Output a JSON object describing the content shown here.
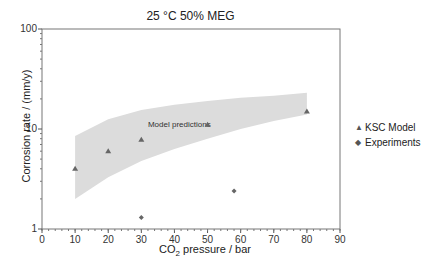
{
  "chart_data": {
    "type": "scatter",
    "title": "25 °C 50% MEG",
    "xlabel": "CO2 pressure / bar",
    "ylabel": "Corrosion rate / (mm/y)",
    "xlim": [
      0,
      90
    ],
    "ylim": [
      1,
      100
    ],
    "yscale": "log",
    "xticks": [
      0,
      10,
      20,
      30,
      40,
      50,
      60,
      70,
      80,
      90
    ],
    "yticks": [
      1,
      10,
      100
    ],
    "grid": false,
    "legend_position": "right",
    "series": [
      {
        "name": "KSC Model",
        "marker": "triangle",
        "color": "#666666",
        "x": [
          10,
          20,
          30,
          50,
          80
        ],
        "y": [
          4.0,
          6.0,
          7.8,
          11.0,
          15.0
        ]
      },
      {
        "name": "Experiments",
        "marker": "diamond",
        "color": "#666666",
        "x": [
          30,
          58
        ],
        "y": [
          1.3,
          2.4
        ]
      }
    ],
    "band": {
      "label": "Model predictions",
      "color": "#dcdcdc",
      "x": [
        10,
        20,
        30,
        40,
        50,
        60,
        70,
        80
      ],
      "upper": [
        8.5,
        12.5,
        15.5,
        17.5,
        19.0,
        20.5,
        21.5,
        23.0
      ],
      "lower": [
        2.0,
        3.3,
        4.8,
        6.3,
        8.0,
        10.0,
        12.0,
        14.0
      ]
    }
  },
  "labels": {
    "title": "25 °C 50% MEG",
    "ylabel": "Corrosion rate / (mm/y)",
    "xlabel_main": "CO",
    "xlabel_sub": "2",
    "xlabel_rest": " pressure / bar",
    "band_label": "Model predictions"
  },
  "legend": [
    {
      "marker": "▲",
      "label": "KSC Model"
    },
    {
      "marker": "◆",
      "label": "Experiments"
    }
  ]
}
